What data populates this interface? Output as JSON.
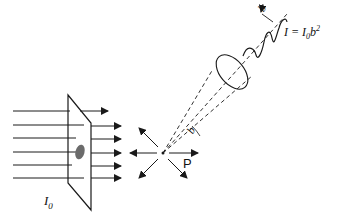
{
  "diagram": {
    "title": "",
    "labels": {
      "formula": {
        "I": "I",
        "eq": " = ",
        "I0": "I",
        "sub0": "0",
        "b": "b",
        "exp": "2"
      },
      "incident_intensity": {
        "I": "I",
        "sub": "0"
      },
      "scattering_center": "P",
      "amplitude": "b",
      "solid_angle": "b"
    },
    "elements": [
      "incident parallel beam (6 rays)",
      "sample plate with particle",
      "transmitted rays",
      "scattering point P with scattered arrows",
      "detection cone (dashed) with aperture ellipse",
      "scattered wave with amplitude b"
    ],
    "colors": {
      "stroke": "#1a1a1a",
      "particle": "#6b6b6b"
    }
  }
}
